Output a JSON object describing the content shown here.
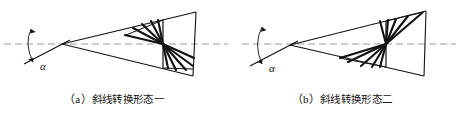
{
  "figure": {
    "kind": "line-diagram",
    "stroke_color": "#121212",
    "axis_color": "#9a9a9a",
    "background": "#ffffff"
  },
  "panels": [
    {
      "id": "a",
      "index_label": "（a）",
      "caption": "斜线转换形态一",
      "angle_label": "α",
      "axis": "horizontal-dashed-centerline",
      "fan_direction": "upper-left-and-lower-right"
    },
    {
      "id": "b",
      "index_label": "（b）",
      "caption": "斜线转换形态二",
      "angle_label": "α",
      "axis": "horizontal-dashed-centerline",
      "fan_direction": "upper-right-and-lower-left"
    }
  ]
}
